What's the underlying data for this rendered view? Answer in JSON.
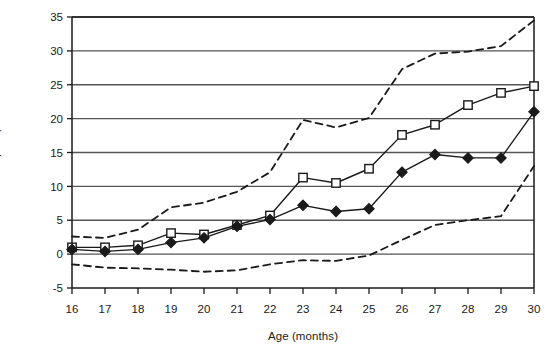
{
  "chart_data": {
    "type": "line",
    "title": "",
    "xlabel": "Age (months)",
    "ylabel": "Number of more complex phrases",
    "x": [
      16,
      17,
      18,
      19,
      20,
      21,
      22,
      23,
      24,
      25,
      26,
      27,
      28,
      29,
      30
    ],
    "xtick_labels": [
      "16",
      "17",
      "18",
      "19",
      "20",
      "21",
      "22",
      "23",
      "24",
      "25",
      "26",
      "27",
      "28",
      "29",
      "30"
    ],
    "ytick_labels": [
      "-5",
      "0",
      "5",
      "10",
      "15",
      "20",
      "25",
      "30",
      "35"
    ],
    "yticks": [
      -5,
      0,
      5,
      10,
      15,
      20,
      25,
      30,
      35
    ],
    "xlim": [
      16,
      30
    ],
    "ylim": [
      -5,
      35
    ],
    "grid": "horizontal",
    "legend": "none",
    "series": [
      {
        "name": "open-square-series",
        "marker": "open-square",
        "linestyle": "solid",
        "values": [
          1.0,
          1.0,
          1.3,
          3.1,
          2.9,
          4.3,
          5.7,
          11.3,
          10.5,
          12.6,
          17.6,
          19.1,
          22.0,
          23.8,
          24.8
        ]
      },
      {
        "name": "filled-diamond-series",
        "marker": "filled-diamond",
        "linestyle": "solid",
        "values": [
          0.7,
          0.4,
          0.7,
          1.7,
          2.4,
          4.1,
          5.1,
          7.2,
          6.3,
          6.7,
          12.1,
          14.7,
          14.2,
          14.2,
          21.0
        ]
      },
      {
        "name": "upper-confidence-band",
        "marker": "none",
        "linestyle": "dashed",
        "values": [
          2.6,
          2.4,
          3.6,
          6.9,
          7.6,
          9.2,
          12.1,
          19.8,
          18.7,
          20.1,
          27.3,
          29.6,
          29.9,
          30.7,
          34.5
        ]
      },
      {
        "name": "lower-confidence-band",
        "marker": "none",
        "linestyle": "dashed",
        "values": [
          -1.5,
          -2.0,
          -2.1,
          -2.3,
          -2.6,
          -2.4,
          -1.5,
          -0.9,
          -1.0,
          -0.2,
          2.1,
          4.3,
          5.0,
          5.6,
          13.0
        ]
      }
    ],
    "colors": {
      "line": "#1a1a1a",
      "grid": "#555555",
      "axis": "#1a1a1a",
      "marker_fill_open": "#ffffff",
      "marker_fill_solid": "#1a1a1a"
    }
  }
}
